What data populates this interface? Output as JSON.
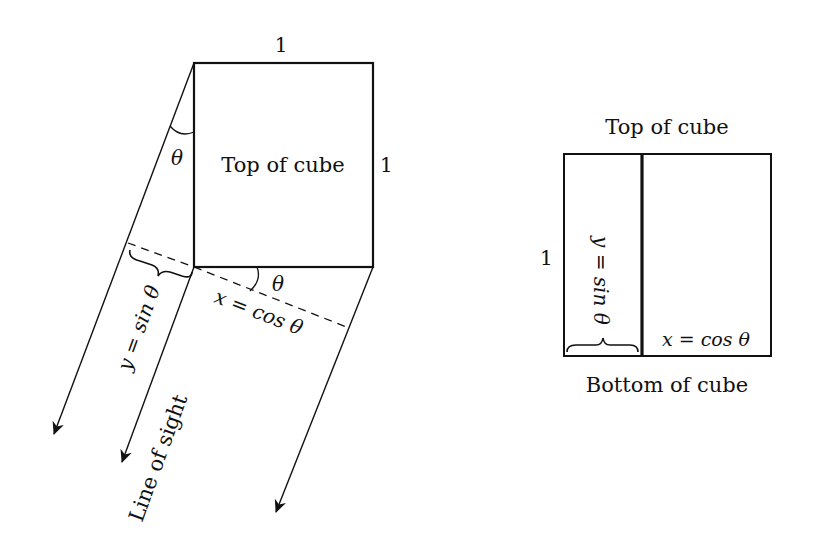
{
  "left_diagram": {
    "top_edge_label": "1",
    "right_edge_label": "1",
    "square_label": "Top of cube",
    "angle_top": "θ",
    "angle_bottom": "θ",
    "y_label": "y = sin θ",
    "x_label": "x = cos θ",
    "sight_label": "Line of sight"
  },
  "right_diagram": {
    "top_label": "Top of cube",
    "bottom_label": "Bottom of cube",
    "side_label": "1",
    "y_label": "y = sin θ",
    "x_label": "x = cos θ"
  },
  "colors": {
    "stroke": "#111111",
    "background": "#ffffff"
  }
}
